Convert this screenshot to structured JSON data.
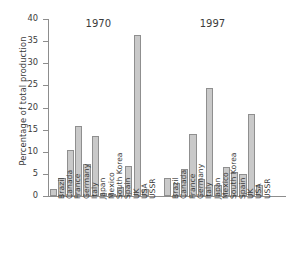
{
  "chart_data": {
    "type": "bar",
    "title": "",
    "xlabel": "",
    "ylabel": "Percentage of total production",
    "ylim": [
      0,
      40
    ],
    "yticks": [
      0,
      5,
      10,
      15,
      20,
      25,
      30,
      35,
      40
    ],
    "grid": false,
    "legend": "none",
    "group_labels": [
      "1970",
      "1997"
    ],
    "categories": [
      "Brazil",
      "Canada",
      "France",
      "Germany",
      "Italy",
      "Japan",
      "Mexico",
      "South Korea",
      "Spain",
      "UK",
      "USA",
      "USSR"
    ],
    "series": [
      {
        "name": "1970",
        "values": [
          1.5,
          4.0,
          10.5,
          15.8,
          7.3,
          13.5,
          0.7,
          0.2,
          2.0,
          6.7,
          36.5,
          1.5
        ]
      },
      {
        "name": "1997",
        "values": [
          4.0,
          3.0,
          6.1,
          14.1,
          3.8,
          24.5,
          2.4,
          6.6,
          5.5,
          4.9,
          18.5,
          2.4
        ]
      }
    ],
    "bar_fill_color": "#c9c9c9",
    "bar_edge_color": "#8f8f8f",
    "axis_color": "#8d8d8d",
    "text_color": "#3b3b3b"
  }
}
